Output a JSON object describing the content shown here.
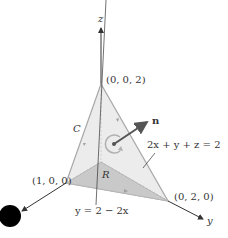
{
  "figure": {
    "axes": {
      "z_label": "z",
      "y_label": "y"
    },
    "points": {
      "top": "(0, 0, 2)",
      "left": "(1, 0, 0)",
      "right": "(0, 2, 0)"
    },
    "labels": {
      "normal": "n",
      "curve": "C",
      "region": "R",
      "plane_equation": "2x + y + z = 2",
      "line_equation": "y = 2 − 2x"
    },
    "colors": {
      "plane_fill": "#ececec",
      "region_fill": "#c9c9c9",
      "edge": "#a8a8a8",
      "axis": "#333333",
      "normal": "#555555",
      "dot": "#000000"
    }
  }
}
